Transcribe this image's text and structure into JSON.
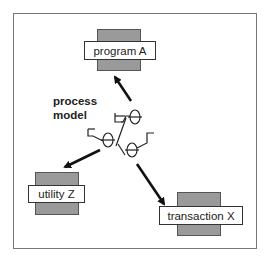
{
  "diagram": {
    "caption_line1": "process",
    "caption_line2": "model",
    "nodes": [
      {
        "id": "program",
        "label": "program A"
      },
      {
        "id": "utility",
        "label": "utility Z"
      },
      {
        "id": "transaction",
        "label": "transaction X"
      }
    ],
    "edges": [
      {
        "from": "process model",
        "to": "program A"
      },
      {
        "from": "process model",
        "to": "utility Z"
      },
      {
        "from": "process model",
        "to": "transaction X"
      }
    ],
    "colors": {
      "frame": "#777777",
      "node_back": "#9a9a9a",
      "node_label_bg": "#ffffff",
      "arrow": "#111111"
    }
  }
}
